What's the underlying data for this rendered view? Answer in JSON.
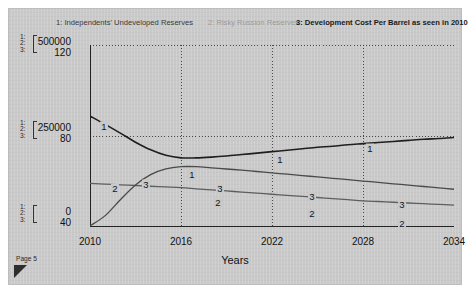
{
  "card": {
    "page_label": "Page 5",
    "grip_icon": "resize-grip-icon"
  },
  "legend": {
    "items": [
      {
        "label": "1: Independents' Undeveloped Reserves",
        "color": "#3a3a3a"
      },
      {
        "label": "2: Risky Russion Reserves",
        "color": "#9a9a9a"
      },
      {
        "label": "3: Development Cost Per Barrel as seen in 2010",
        "color": "#1a1a1a"
      }
    ]
  },
  "axis_index": {
    "rows": [
      "1:",
      "2:",
      "3:"
    ]
  },
  "y_ticks": [
    {
      "primary": "500000",
      "secondary": "120"
    },
    {
      "primary": "250000",
      "secondary": "80"
    },
    {
      "primary": "0",
      "secondary": "40"
    }
  ],
  "chart_data": {
    "type": "line",
    "title": "",
    "xlabel": "Years",
    "ylabel": "",
    "grid": true,
    "legend_position": "top",
    "x": [
      2010,
      2011,
      2012,
      2013,
      2014,
      2015,
      2016,
      2017,
      2018,
      2019,
      2020,
      2021,
      2022,
      2023,
      2024,
      2025,
      2026,
      2027,
      2028,
      2029,
      2030,
      2031,
      2032,
      2033,
      2034
    ],
    "xlim": [
      2010,
      2034
    ],
    "xticks": [
      2010,
      2016,
      2022,
      2028,
      2034
    ],
    "axes": [
      {
        "id": 1,
        "name": "reserves-axis",
        "ylim": [
          0,
          500000
        ],
        "yticks": [
          0,
          250000,
          500000
        ],
        "tick_labels": [
          "0",
          "250000",
          "500000"
        ]
      },
      {
        "id": 3,
        "name": "cost-axis",
        "ylim": [
          40,
          120
        ],
        "yticks": [
          40,
          80,
          120
        ],
        "tick_labels": [
          "40",
          "80",
          "120"
        ]
      }
    ],
    "series": [
      {
        "name": "1: Independents' Undeveloped Reserves",
        "marker_label": "1",
        "axis": 1,
        "color": "#1f1f1f",
        "width": 1.6,
        "values": [
          305000,
          282000,
          258000,
          233000,
          212000,
          197000,
          190000,
          190000,
          192000,
          195000,
          199000,
          203000,
          207000,
          211000,
          215000,
          219000,
          222000,
          226000,
          229000,
          232000,
          235000,
          238000,
          241000,
          243000,
          246000
        ]
      },
      {
        "name": "2: Risky Russion Reserves",
        "marker_label": "2",
        "axis": 1,
        "color": "#5e5e5e",
        "width": 1.3,
        "values": [
          120000,
          118000,
          116000,
          114000,
          112000,
          110000,
          108000,
          105000,
          102000,
          99000,
          96000,
          93000,
          90000,
          87000,
          84000,
          81000,
          78000,
          75000,
          72000,
          70000,
          68000,
          66000,
          64000,
          62000,
          60000
        ]
      },
      {
        "name": "3: Development Cost Per Barrel as seen in 2010",
        "marker_label": "3",
        "axis": 3,
        "color": "#4a4a4a",
        "width": 1.3,
        "values": [
          40.5,
          45.0,
          52.0,
          58.5,
          63.0,
          65.5,
          66.5,
          66.5,
          66.0,
          65.5,
          65.0,
          64.4,
          63.8,
          63.2,
          62.6,
          62.0,
          61.4,
          60.8,
          60.2,
          59.6,
          59.0,
          58.4,
          57.8,
          57.2,
          56.6
        ]
      }
    ],
    "inline_labels": [
      {
        "series": 1,
        "text": "1",
        "x": 2011,
        "px": 14,
        "py": 85
      },
      {
        "series": 1,
        "text": "1",
        "x": 2017,
        "px": 102,
        "py": 133
      },
      {
        "series": 1,
        "text": "1",
        "x": 2022,
        "px": 190,
        "py": 118
      },
      {
        "series": 1,
        "text": "1",
        "x": 2028,
        "px": 280,
        "py": 107
      },
      {
        "series": 2,
        "text": "2",
        "x": 2012,
        "px": 25,
        "py": 147
      },
      {
        "series": 2,
        "text": "2",
        "x": 2019,
        "px": 128,
        "py": 161
      },
      {
        "series": 2,
        "text": "2",
        "x": 2025,
        "px": 222,
        "py": 172
      },
      {
        "series": 2,
        "text": "2",
        "x": 2031,
        "px": 312,
        "py": 182
      },
      {
        "series": 3,
        "text": "3",
        "x": 2014,
        "px": 56,
        "py": 143
      },
      {
        "series": 3,
        "text": "3",
        "x": 2019,
        "px": 130,
        "py": 147
      },
      {
        "series": 3,
        "text": "3",
        "x": 2025,
        "px": 222,
        "py": 155
      },
      {
        "series": 3,
        "text": "3",
        "x": 2031,
        "px": 312,
        "py": 163
      }
    ]
  }
}
